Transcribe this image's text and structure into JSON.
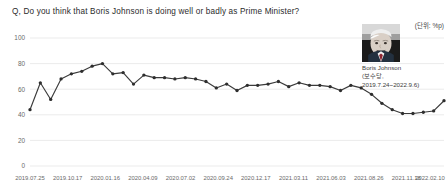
{
  "title": "Q, Do you think that Boris Johnson is doing well or badly as Prime Minister?",
  "unit_note": "(단위: %p)",
  "portrait": {
    "icon": "politician-portrait-photo",
    "name": "Boris Johnson",
    "party_line": "(보수당,",
    "term_line": "2019.7.24~2022.9.6)"
  },
  "colors": {
    "line": "#3b3b3b",
    "marker": "#2e2e2e",
    "grid": "#e2e2e2",
    "tick_text": "#6a6a6a",
    "title_text": "#2b2b2b"
  },
  "chart_data": {
    "type": "line",
    "title": "Q, Do you think that Boris Johnson is doing well or badly as Prime Minister?",
    "xlabel": "",
    "ylabel": "",
    "ylim": [
      0,
      100
    ],
    "yticks": [
      0,
      20,
      40,
      60,
      80,
      100
    ],
    "grid": true,
    "legend": "none",
    "xticks": [
      "2019.07.25",
      "2019.10.17",
      "2020.01.16",
      "2020.04.09",
      "2020.07.02",
      "2020.09.24",
      "2020.12.17",
      "2021.03.11",
      "2021.06.03",
      "2021.08.26",
      "2021.11.18",
      "2022.02.10"
    ],
    "series": [
      {
        "name": "Doing well",
        "values": [
          44,
          65,
          52,
          68,
          72,
          74,
          78,
          80,
          72,
          73,
          64,
          71,
          69,
          69,
          68,
          69,
          68,
          66,
          61,
          64,
          59,
          63,
          63,
          64,
          66,
          62,
          65,
          63,
          63,
          62,
          59,
          63,
          61,
          56,
          49,
          44,
          41,
          41,
          42,
          43,
          51
        ]
      }
    ]
  }
}
